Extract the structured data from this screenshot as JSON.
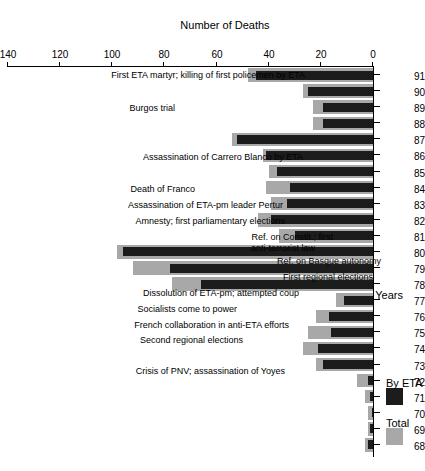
{
  "chart_data": {
    "type": "bar",
    "orientation": "horizontal",
    "title": "",
    "xlabel": "Number of Deaths",
    "ylabel": "Years",
    "xlim": [
      0,
      140
    ],
    "xticks": [
      0,
      20,
      40,
      60,
      80,
      100,
      120,
      140
    ],
    "grid": false,
    "legend_position": "top-left",
    "categories": [
      "68",
      "69",
      "70",
      "71",
      "72",
      "73",
      "74",
      "75",
      "76",
      "77",
      "78",
      "79",
      "80",
      "81",
      "82",
      "83",
      "84",
      "85",
      "86",
      "87",
      "88",
      "89",
      "90",
      "91"
    ],
    "series": [
      {
        "name": "Total",
        "color": "#a8a8a8",
        "values": [
          3,
          2,
          2,
          3,
          6,
          22,
          27,
          25,
          22,
          14,
          77,
          92,
          98,
          36,
          44,
          39,
          41,
          40,
          42,
          54,
          23,
          23,
          27,
          48
        ]
      },
      {
        "name": "By ETA",
        "color": "#1c1c1c",
        "values": [
          2,
          1,
          0,
          1,
          2,
          19,
          21,
          16,
          17,
          11,
          66,
          78,
          96,
          30,
          39,
          33,
          32,
          37,
          41,
          52,
          19,
          19,
          25,
          45
        ]
      }
    ],
    "annotations": [
      {
        "year": "68",
        "text": "First ETA martyr; killing of first policemen by ETA"
      },
      {
        "year": "70",
        "text": "Burgos trial"
      },
      {
        "year": "73",
        "text": "Assassination of Carrero Blanco by ETA"
      },
      {
        "year": "75",
        "text": "Death of Franco"
      },
      {
        "year": "76",
        "text": "Assassination of ETA-pm leader Pertur"
      },
      {
        "year": "77",
        "text": "Amnesty; first parliamentary elections"
      },
      {
        "year": "78",
        "text": "Ref. on Constit.; first"
      },
      {
        "year": "78",
        "text": "anti-terrorist law"
      },
      {
        "year": "79",
        "text": "Ref. on Basque autonomy"
      },
      {
        "year": "80",
        "text": "First regional elections"
      },
      {
        "year": "81",
        "text": "Dissolution of ETA-pm; attempted coup"
      },
      {
        "year": "82",
        "text": "Socialists come to power"
      },
      {
        "year": "83",
        "text": "French collaboration in anti-ETA efforts"
      },
      {
        "year": "84",
        "text": "Second regional elections"
      },
      {
        "year": "86",
        "text": "Crisis of PNV; assassination of Yoyes"
      }
    ]
  },
  "axes": {
    "x_title": "Number of Deaths",
    "y_title": "Years",
    "x_ticks": [
      "0",
      "20",
      "40",
      "60",
      "80",
      "100",
      "120",
      "140"
    ],
    "y_ticks": [
      "68",
      "69",
      "70",
      "71",
      "72",
      "73",
      "74",
      "75",
      "76",
      "77",
      "78",
      "79",
      "80",
      "81",
      "82",
      "83",
      "84",
      "85",
      "86",
      "87",
      "88",
      "89",
      "90",
      "91"
    ]
  },
  "legend": {
    "entries": [
      {
        "label": "Total",
        "color": "#a8a8a8"
      },
      {
        "label": "By ETA",
        "color": "#1c1c1c"
      }
    ]
  }
}
